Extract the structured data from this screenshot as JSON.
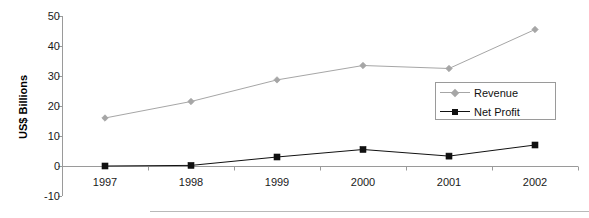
{
  "chart_data": {
    "type": "line",
    "title": "",
    "xlabel": "",
    "ylabel": "US$ Billions",
    "categories": [
      "1997",
      "1998",
      "1999",
      "2000",
      "2001",
      "2002"
    ],
    "yticks": [
      50,
      40,
      30,
      20,
      10,
      0,
      -10
    ],
    "ylim": [
      -10,
      50
    ],
    "grid": false,
    "legend_position": "right-inside",
    "series": [
      {
        "name": "Revenue",
        "color": "#a6a6a6",
        "marker": "diamond",
        "values": [
          16,
          21.5,
          28.7,
          33.5,
          32.5,
          45.5
        ]
      },
      {
        "name": "Net Profit",
        "color": "#111111",
        "marker": "square",
        "values": [
          0,
          0.2,
          3,
          5.5,
          3.3,
          7
        ]
      }
    ]
  },
  "axis": {
    "y_title": "US$ Billions",
    "y_tick_labels": [
      "50",
      "40",
      "30",
      "20",
      "10",
      "0",
      "-10"
    ],
    "x_tick_labels": [
      "1997",
      "1998",
      "1999",
      "2000",
      "2001",
      "2002"
    ]
  },
  "legend": {
    "items": [
      {
        "label": "Revenue"
      },
      {
        "label": "Net Profit"
      }
    ]
  },
  "colors": {
    "revenue": "#a6a6a6",
    "net_profit": "#111111",
    "axis": "#9a9a9a",
    "text": "#1a1a1a"
  }
}
